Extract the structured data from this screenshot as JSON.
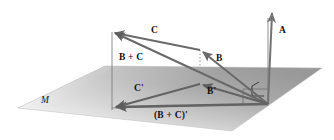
{
  "figure": {
    "background_color": "#ffffff",
    "labels": {
      "vector_c": "C",
      "vector_b_plus_c": "B + C",
      "vector_b": "B",
      "vector_a": "A",
      "vector_c_prime": "C'",
      "vector_b_prime": "B'",
      "vector_b_plus_c_prime": "(B + C)'",
      "plane": "M"
    },
    "colors": {
      "vector_stroke": "#6f6f6f",
      "vector_stroke_dark": "#5a5a5a",
      "guide_line": "#7a7a7a",
      "dotted_projection": "#9a9a9a",
      "plane_fill_near": "#9a9a9a",
      "plane_fill_far": "#f2f2f2",
      "label_text": "#121212",
      "right_angle_marker": "#3a3a3a"
    },
    "geometry": {
      "origin": {
        "x": 268,
        "y": 104
      },
      "apex_b_plus_c": {
        "x": 112,
        "y": 32
      },
      "tip_b": {
        "x": 200,
        "y": 50
      },
      "tip_b_prime": {
        "x": 200,
        "y": 84
      },
      "tip_b_plus_c_prime": {
        "x": 112,
        "y": 108
      },
      "tip_a": {
        "x": 272,
        "y": 10
      },
      "plane_corners": [
        {
          "x": 18,
          "y": 108
        },
        {
          "x": 105,
          "y": 66
        },
        {
          "x": 322,
          "y": 68
        },
        {
          "x": 232,
          "y": 131
        }
      ]
    }
  }
}
